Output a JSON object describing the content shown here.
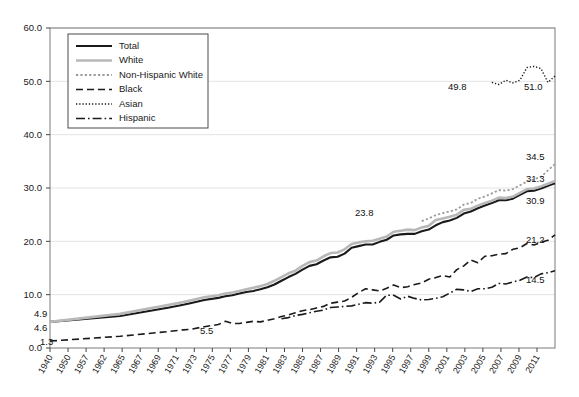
{
  "chart_data": {
    "type": "line",
    "title": "",
    "subtitle": "",
    "xlabel": "",
    "ylabel": "",
    "grid": true,
    "legend_position": "top-left",
    "ylim": [
      0.0,
      60.0
    ],
    "ytick_labels": [
      "0.0",
      "10.0",
      "20.0",
      "30.0",
      "40.0",
      "50.0",
      "60.0"
    ],
    "ytick_values": [
      0,
      10,
      20,
      30,
      40,
      50,
      60
    ],
    "xtick_labels": [
      "1940",
      "1950",
      "1957",
      "1962",
      "1965",
      "1967",
      "1969",
      "1971",
      "1973",
      "1975",
      "1977",
      "1979",
      "1981",
      "1983",
      "1985",
      "1987",
      "1989",
      "1991",
      "1993",
      "1995",
      "1997",
      "1999",
      "2001",
      "2003",
      "2005",
      "2007",
      "2009",
      "2011"
    ],
    "x": [
      1940,
      1950,
      1957,
      1959,
      1960,
      1962,
      1964,
      1965,
      1966,
      1967,
      1968,
      1969,
      1970,
      1971,
      1972,
      1973,
      1974,
      1975,
      1976,
      1977,
      1978,
      1979,
      1980,
      1981,
      1982,
      1983,
      1984,
      1985,
      1986,
      1987,
      1988,
      1989,
      1990,
      1991,
      1992,
      1993,
      1994,
      1995,
      1996,
      1997,
      1998,
      1999,
      2000,
      2001,
      2002,
      2003,
      2004,
      2005,
      2006,
      2007,
      2008,
      2009,
      2010,
      2011,
      2012
    ],
    "series": [
      {
        "name": "Total",
        "style": "solid",
        "color": "#1a1a1a",
        "width": 2.1,
        "start_label": "4.9",
        "end_label": "30.9",
        "values": [
          4.9,
          6.0,
          7.6,
          8.1,
          8.4,
          9.0,
          9.4,
          9.7,
          9.9,
          10.2,
          10.5,
          10.7,
          11.0,
          11.4,
          11.9,
          12.6,
          13.3,
          13.9,
          14.7,
          15.4,
          15.7,
          16.4,
          17.0,
          17.1,
          17.7,
          18.8,
          19.1,
          19.4,
          19.4,
          19.9,
          20.3,
          21.1,
          21.3,
          21.4,
          21.4,
          21.9,
          22.2,
          23.0,
          23.6,
          23.9,
          24.4,
          25.2,
          25.6,
          26.2,
          26.7,
          27.2,
          27.7,
          27.7,
          28.0,
          28.7,
          29.4,
          29.5,
          29.9,
          30.4,
          30.9
        ]
      },
      {
        "name": "White",
        "style": "solid",
        "color": "#b8b8b8",
        "width": 2.6,
        "start_label": "4.6",
        "end_label": "31.3",
        "values": [
          4.9,
          6.4,
          8.1,
          8.6,
          8.9,
          9.5,
          9.9,
          10.2,
          10.4,
          10.7,
          11.0,
          11.3,
          11.6,
          12.0,
          12.6,
          13.3,
          14.0,
          14.5,
          15.4,
          16.1,
          16.4,
          17.2,
          17.8,
          17.9,
          18.5,
          19.5,
          19.8,
          20.0,
          20.1,
          20.5,
          20.9,
          21.8,
          22.0,
          22.2,
          22.1,
          22.6,
          22.9,
          24.0,
          24.3,
          24.6,
          25.0,
          25.9,
          26.1,
          26.7,
          27.2,
          27.6,
          28.2,
          28.1,
          28.4,
          29.1,
          29.8,
          29.9,
          30.3,
          30.8,
          31.3
        ]
      },
      {
        "name": "Non-Hispanic White",
        "style": "dotted-fine",
        "color": "#9a9a9a",
        "width": 1.8,
        "start_label": "23.8",
        "end_label": "34.5",
        "values": [
          null,
          null,
          null,
          null,
          null,
          null,
          null,
          null,
          null,
          null,
          null,
          null,
          null,
          null,
          null,
          null,
          null,
          null,
          null,
          null,
          null,
          null,
          null,
          null,
          null,
          null,
          null,
          null,
          null,
          null,
          null,
          null,
          null,
          null,
          null,
          23.8,
          24.3,
          24.9,
          25.3,
          25.6,
          26.0,
          26.9,
          27.2,
          28.0,
          28.4,
          29.0,
          29.6,
          29.5,
          29.8,
          30.5,
          31.2,
          31.6,
          32.1,
          33.3,
          34.5
        ]
      },
      {
        "name": "Black",
        "style": "dashed",
        "color": "#1a1a1a",
        "width": 1.6,
        "start_label": "1.3",
        "end_label": "21.2",
        "values": [
          1.3,
          2.2,
          3.1,
          3.4,
          3.5,
          4.0,
          4.4,
          5.0,
          4.6,
          4.6,
          4.8,
          5.0,
          4.9,
          5.2,
          5.5,
          5.9,
          6.2,
          6.6,
          7.0,
          7.2,
          7.5,
          7.8,
          8.4,
          8.6,
          8.8,
          9.5,
          10.4,
          11.1,
          10.9,
          10.7,
          11.2,
          11.8,
          11.3,
          11.5,
          11.9,
          12.2,
          12.9,
          13.2,
          13.6,
          13.3,
          14.7,
          15.4,
          16.5,
          16.0,
          17.2,
          17.3,
          17.6,
          17.7,
          18.5,
          18.8,
          19.6,
          19.3,
          19.8,
          20.2,
          21.2
        ]
      },
      {
        "name": "Asian",
        "style": "dotted-very-fine",
        "color": "#1a1a1a",
        "width": 1.4,
        "start_label": "49.8",
        "end_label": "51.0",
        "values": [
          null,
          null,
          null,
          null,
          null,
          null,
          null,
          null,
          null,
          null,
          null,
          null,
          null,
          null,
          null,
          null,
          null,
          null,
          null,
          null,
          null,
          null,
          null,
          null,
          null,
          null,
          null,
          null,
          null,
          null,
          null,
          null,
          null,
          null,
          null,
          null,
          null,
          null,
          null,
          null,
          null,
          null,
          null,
          null,
          null,
          49.8,
          49.4,
          50.2,
          49.7,
          50.2,
          52.6,
          52.8,
          52.4,
          49.8,
          51.0
        ]
      },
      {
        "name": "Hispanic",
        "style": "dash-dot",
        "color": "#1a1a1a",
        "width": 1.6,
        "start_label": "5.5",
        "end_label": "14.5",
        "values": [
          null,
          null,
          null,
          null,
          null,
          null,
          null,
          null,
          null,
          null,
          null,
          null,
          null,
          null,
          null,
          5.5,
          5.7,
          6.1,
          6.3,
          6.6,
          6.9,
          7.1,
          7.6,
          7.7,
          7.8,
          7.9,
          8.2,
          8.5,
          8.4,
          8.6,
          9.9,
          9.9,
          9.2,
          9.7,
          9.3,
          9.0,
          9.1,
          9.3,
          9.6,
          10.3,
          11.0,
          10.9,
          10.6,
          11.1,
          11.1,
          11.4,
          12.1,
          12.0,
          12.4,
          12.7,
          13.3,
          13.2,
          13.9,
          14.1,
          14.5
        ]
      }
    ],
    "annotations": [
      {
        "text": "4.9",
        "series": "Total",
        "side": "left"
      },
      {
        "text": "4.6",
        "series": "White",
        "side": "left"
      },
      {
        "text": "1.3",
        "series": "Black",
        "side": "left"
      },
      {
        "text": "5.5",
        "series": "Hispanic",
        "side": "mid"
      },
      {
        "text": "23.8",
        "series": "Non-Hispanic White",
        "side": "mid"
      },
      {
        "text": "49.8",
        "series": "Asian",
        "side": "mid"
      },
      {
        "text": "51.0",
        "series": "Asian",
        "side": "right"
      },
      {
        "text": "34.5",
        "series": "Non-Hispanic White",
        "side": "right"
      },
      {
        "text": "31.3",
        "series": "White",
        "side": "right"
      },
      {
        "text": "30.9",
        "series": "Total",
        "side": "right"
      },
      {
        "text": "21.2",
        "series": "Black",
        "side": "right"
      },
      {
        "text": "14.5",
        "series": "Hispanic",
        "side": "right"
      }
    ]
  },
  "legend": {
    "items": [
      {
        "label": "Total"
      },
      {
        "label": "White"
      },
      {
        "label": "Non-Hispanic White"
      },
      {
        "label": "Black"
      },
      {
        "label": "Asian"
      },
      {
        "label": "Hispanic"
      }
    ]
  }
}
